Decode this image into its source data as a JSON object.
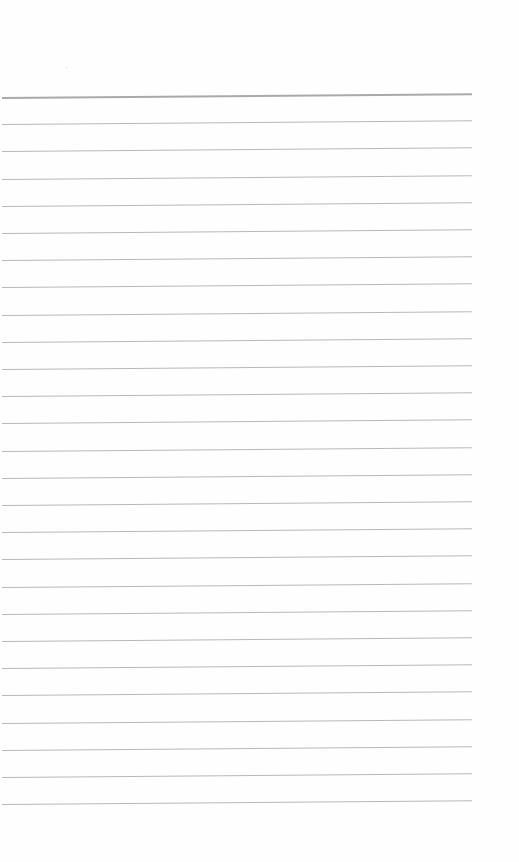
{
  "page": {
    "type": "lined-paper",
    "background_color": "#fefefe",
    "rule_color": "#b8b8b8",
    "top_rule_color": "#a9a9a9",
    "line_count": 27,
    "first_line_y": 97,
    "line_spacing": 27.2,
    "text": ""
  }
}
